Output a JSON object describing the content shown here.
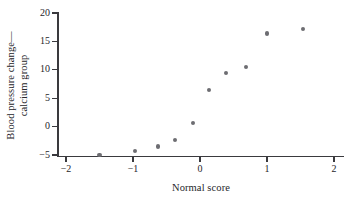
{
  "chart_data": {
    "type": "scatter",
    "title": "",
    "xlabel": "Normal score",
    "ylabel": "Blood pressure change—calcium group",
    "ylabel_line1": "Blood pressure change—",
    "ylabel_line2": "calcium group",
    "xlim": [
      -2.3,
      2.2
    ],
    "ylim": [
      -6.5,
      21
    ],
    "xticks": [
      -2,
      -1,
      0,
      1,
      2
    ],
    "xtick_labels": [
      "−2",
      "−1",
      "0",
      "1",
      "2"
    ],
    "yticks": [
      -5,
      0,
      5,
      10,
      15,
      20
    ],
    "ytick_labels": [
      "−5",
      "0",
      "5",
      "10",
      "15",
      "20"
    ],
    "grid": false,
    "legend": null,
    "marker_color": "#6d6d72",
    "axis_color": "#3a3a3e",
    "marker_shape": "circle",
    "n_points": 10,
    "x": [
      -1.5,
      -0.97,
      -0.63,
      -0.37,
      -0.1,
      0.13,
      0.39,
      0.69,
      1.0,
      1.54
    ],
    "y": [
      -5.0,
      -4.3,
      -3.5,
      -2.4,
      0.6,
      6.5,
      9.5,
      10.5,
      16.4,
      17.2
    ],
    "points": [
      {
        "x": -1.5,
        "y": -5.0
      },
      {
        "x": -0.97,
        "y": -4.3
      },
      {
        "x": -0.63,
        "y": -3.5
      },
      {
        "x": -0.37,
        "y": -2.4
      },
      {
        "x": -0.1,
        "y": 0.6
      },
      {
        "x": 0.13,
        "y": 6.5
      },
      {
        "x": 0.39,
        "y": 9.5
      },
      {
        "x": 0.69,
        "y": 10.5
      },
      {
        "x": 1.0,
        "y": 16.4
      },
      {
        "x": 1.54,
        "y": 17.2
      }
    ]
  }
}
